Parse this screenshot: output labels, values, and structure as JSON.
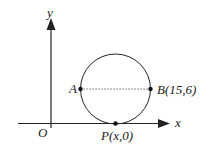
{
  "diagram": {
    "axes": {
      "x_label": "x",
      "y_label": "y",
      "origin_label": "O"
    },
    "points": {
      "A": {
        "label": "A"
      },
      "B": {
        "label": "B(15,6)"
      },
      "P": {
        "label": "P(x,0)"
      }
    },
    "elements": [
      "circle through A, B tangent to x-axis at P",
      "dotted segment AB (diameter)"
    ],
    "colors": {
      "stroke": "#222222",
      "background": "#ffffff"
    }
  }
}
